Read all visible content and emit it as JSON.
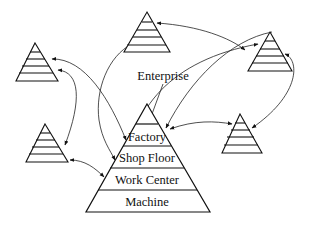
{
  "diagram": {
    "type": "enterprise-hierarchy-network",
    "central_pyramid": {
      "outside_label": "Enterprise",
      "layers": [
        "Factory",
        "Shop Floor",
        "Work Center",
        "Machine"
      ]
    },
    "peer_pyramids_count": 5,
    "colors": {
      "stroke": "#111111",
      "background": "#ffffff"
    }
  }
}
